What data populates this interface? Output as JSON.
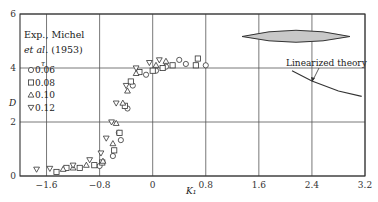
{
  "chart_data": {
    "type": "scatter",
    "title": "",
    "xlabel": "K₁",
    "ylabel": "D",
    "xlim": [
      -2.0,
      3.2
    ],
    "ylim": [
      0,
      6
    ],
    "x_ticks": [
      "-1.6",
      "-0.8",
      "0",
      "0.8",
      "1.6",
      "2.4",
      "3.2"
    ],
    "y_ticks": [
      "0",
      "2",
      "4",
      "6"
    ],
    "grid": true,
    "legend": {
      "title_line1": "Exp., Michel",
      "title_line2_italic": "et al.",
      "title_line2_rest": " (1953)",
      "param_symbol": "τ",
      "position": "upper-left",
      "entries": [
        {
          "marker": "circle",
          "label": "0.06"
        },
        {
          "marker": "square",
          "label": "0.08"
        },
        {
          "marker": "triangle-up",
          "label": "0.10"
        },
        {
          "marker": "triangle-down",
          "label": "0.12"
        }
      ]
    },
    "annotation": "Linearized theory",
    "series": [
      {
        "name": "0.06",
        "marker": "circle",
        "points": [
          [
            -0.8,
            0.37
          ],
          [
            -0.6,
            0.74
          ],
          [
            -0.48,
            1.33
          ],
          [
            -0.51,
            1.6
          ],
          [
            -0.38,
            2.5
          ],
          [
            -0.3,
            3.35
          ],
          [
            -0.1,
            3.75
          ],
          [
            0.05,
            3.9
          ],
          [
            0.2,
            4.05
          ],
          [
            0.4,
            4.3
          ],
          [
            0.5,
            4.15
          ],
          [
            0.8,
            4.1
          ]
        ]
      },
      {
        "name": "0.08",
        "marker": "square",
        "points": [
          [
            -1.45,
            0.15
          ],
          [
            -1.3,
            0.3
          ],
          [
            -1.1,
            0.3
          ],
          [
            -0.88,
            0.4
          ],
          [
            -0.76,
            0.5
          ],
          [
            -0.58,
            0.95
          ],
          [
            -0.5,
            1.6
          ],
          [
            -0.42,
            2.6
          ],
          [
            -0.33,
            3.5
          ],
          [
            -0.2,
            3.85
          ],
          [
            0.0,
            3.9
          ],
          [
            0.15,
            4.0
          ],
          [
            0.3,
            4.1
          ],
          [
            0.65,
            4.1
          ],
          [
            0.68,
            4.35
          ]
        ]
      },
      {
        "name": "0.10",
        "marker": "triangle-up",
        "points": [
          [
            -1.35,
            0.25
          ],
          [
            -1.2,
            0.3
          ],
          [
            -1.0,
            0.4
          ],
          [
            -0.75,
            0.55
          ],
          [
            -0.6,
            1.2
          ],
          [
            -0.55,
            1.95
          ],
          [
            -0.45,
            2.7
          ],
          [
            -0.38,
            3.15
          ],
          [
            -0.25,
            3.8
          ],
          [
            0.05,
            4.1
          ],
          [
            0.2,
            4.25
          ]
        ]
      },
      {
        "name": "0.12",
        "marker": "triangle-down",
        "points": [
          [
            -1.75,
            0.25
          ],
          [
            -1.55,
            0.28
          ],
          [
            -1.2,
            0.4
          ],
          [
            -0.95,
            0.6
          ],
          [
            -0.78,
            0.85
          ],
          [
            -0.7,
            1.4
          ],
          [
            -0.62,
            2.0
          ],
          [
            -0.55,
            2.7
          ],
          [
            -0.4,
            3.35
          ],
          [
            -0.25,
            4.0
          ],
          [
            -0.05,
            4.2
          ],
          [
            0.1,
            4.3
          ]
        ]
      },
      {
        "name": "Linearized theory",
        "type": "line",
        "points": [
          [
            2.1,
            3.9
          ],
          [
            2.4,
            3.52
          ],
          [
            2.8,
            3.15
          ],
          [
            3.15,
            2.95
          ]
        ]
      }
    ]
  }
}
